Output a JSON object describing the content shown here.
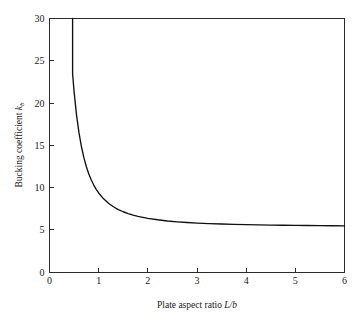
{
  "chart_data": {
    "type": "line",
    "title": "",
    "subtitle": "",
    "xlabel_full": "Plate aspect ratio L/b",
    "xlabel_text": "Plate aspect ratio ",
    "xlabel_var_num": "L",
    "xlabel_slash": "/",
    "xlabel_var_den": "b",
    "ylabel_full": "Bucking coefficient kb",
    "ylabel_text": "Bucking coefficient ",
    "ylabel_var": "k",
    "ylabel_sub": "b",
    "xlim": [
      0,
      6
    ],
    "ylim": [
      0,
      30
    ],
    "xticks": [
      0,
      1,
      2,
      3,
      4,
      5,
      6
    ],
    "yticks": [
      0,
      5,
      10,
      15,
      20,
      25,
      30
    ],
    "xtick_labels": [
      "0",
      "1",
      "2",
      "3",
      "4",
      "5",
      "6"
    ],
    "ytick_labels": [
      "0",
      "5",
      "10",
      "15",
      "20",
      "25",
      "30"
    ],
    "grid": false,
    "legend": false,
    "legend_position": "none",
    "series": [
      {
        "name": "Buckling coefficient",
        "formula": "kb = 5.35 + 4/(L/b)^2",
        "asymptote": 5.35,
        "enters_top_at_x": 0.47,
        "x": [
          0.47,
          0.5,
          0.55,
          0.6,
          0.65,
          0.7,
          0.75,
          0.8,
          0.85,
          0.9,
          0.95,
          1.0,
          1.1,
          1.2,
          1.3,
          1.4,
          1.5,
          1.6,
          1.7,
          1.8,
          1.9,
          2.0,
          2.2,
          2.4,
          2.6,
          2.8,
          3.0,
          3.25,
          3.5,
          3.75,
          4.0,
          4.25,
          4.5,
          4.75,
          5.0,
          5.25,
          5.5,
          5.75,
          6.0
        ],
        "y": [
          23.46,
          21.35,
          18.57,
          16.46,
          14.82,
          13.51,
          12.46,
          11.6,
          10.89,
          10.29,
          9.78,
          9.35,
          8.66,
          8.13,
          7.72,
          7.39,
          7.13,
          6.91,
          6.73,
          6.58,
          6.46,
          6.35,
          6.18,
          6.04,
          5.94,
          5.86,
          5.79,
          5.73,
          5.68,
          5.63,
          5.6,
          5.57,
          5.55,
          5.53,
          5.51,
          5.5,
          5.48,
          5.47,
          5.46
        ]
      }
    ],
    "colors": {
      "curve": "#111111",
      "frame": "#2b2b2b",
      "text": "#1a1a1a",
      "background": "#ffffff"
    }
  }
}
